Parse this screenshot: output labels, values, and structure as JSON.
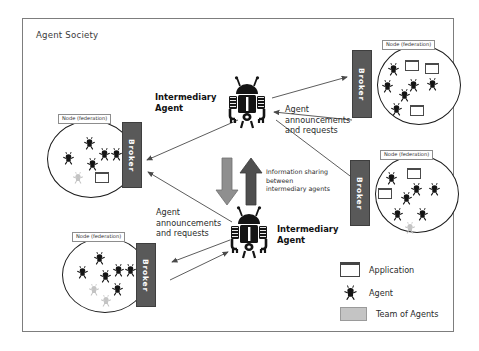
{
  "diagram": {
    "title": "Agent Society",
    "frame_border_color": "#7d7d7d"
  },
  "nodes": [
    {
      "id": "node-left-middle",
      "label": "Node (federation)",
      "broker_label": "Broker",
      "broker_side": "right",
      "agents": 5,
      "team_agents": 1,
      "applications": 1
    },
    {
      "id": "node-top-right",
      "label": "Node (federation)",
      "broker_label": "Broker",
      "broker_side": "left",
      "agents": 5,
      "team_agents": 0,
      "applications": 3
    },
    {
      "id": "node-middle-right",
      "label": "Node (federation)",
      "broker_label": "Broker",
      "broker_side": "left",
      "agents": 5,
      "team_agents": 1,
      "applications": 2
    },
    {
      "id": "node-bottom-left",
      "label": "Node (federation)",
      "broker_label": "Broker",
      "broker_side": "right",
      "agents": 5,
      "team_agents": 2,
      "applications": 0
    }
  ],
  "intermediary_agents": [
    {
      "id": "intermediary-top",
      "caption": "Intermediary\nAgent"
    },
    {
      "id": "intermediary-bottom",
      "caption": "Intermediary\nAgent"
    }
  ],
  "labels": {
    "announcements_right": "Agent\nannouncements\nand requests",
    "announcements_left": "Agent\nannouncements\nand requests",
    "information_sharing": "Information sharing\nbetween\nintermediary agents"
  },
  "legend": {
    "items": [
      {
        "icon": "application-icon",
        "label": "Application"
      },
      {
        "icon": "agent-icon",
        "label": "Agent"
      },
      {
        "icon": "team-of-agents-icon",
        "label": "Team of Agents"
      }
    ]
  },
  "colors": {
    "broker_fill": "#595959",
    "agent_fill": "#141414",
    "team_fill": "#c4c4c4",
    "node_stroke": "#1b1b1b",
    "arrow_stroke": "#4a4a4a",
    "arrow_down_fill": "#8f8f8f",
    "arrow_up_fill": "#4f4f4f"
  }
}
